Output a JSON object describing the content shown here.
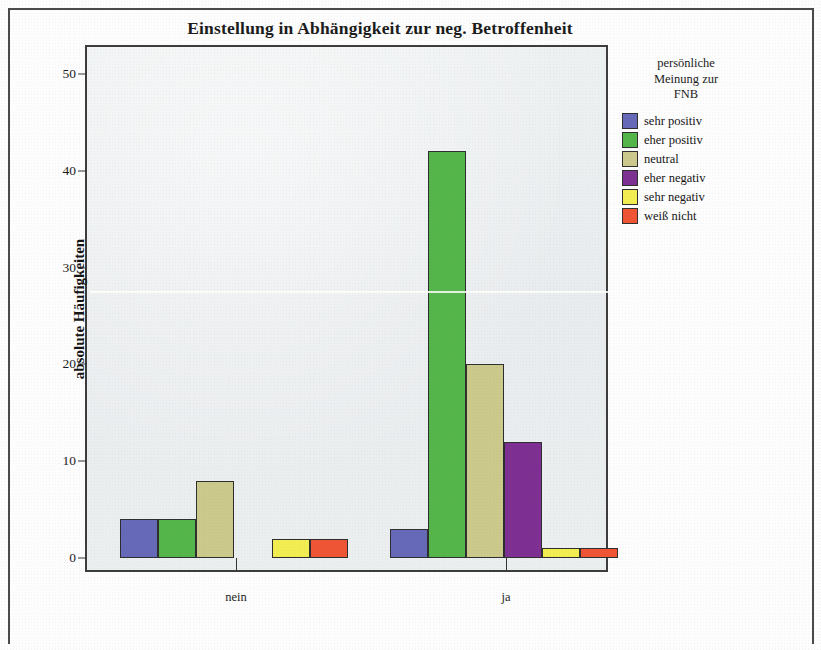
{
  "chart_data": {
    "type": "bar",
    "title": "Einstellung in Abhängigkeit zur neg. Betroffenheit",
    "xlabel": "",
    "ylabel": "absolute Häufigkeiten",
    "categories": [
      "nein",
      "ja"
    ],
    "ylim": [
      0,
      52
    ],
    "yticks": [
      0,
      10,
      20,
      30,
      40,
      50
    ],
    "ytick_labels": [
      "0",
      "10",
      "20",
      "30",
      "40",
      "50"
    ],
    "grid": false,
    "legend_position": "right",
    "legend_title": "persönliche\nMeinung zur\nFNB",
    "legend_title_lines": [
      "persönliche",
      "Meinung zur",
      "FNB"
    ],
    "series": [
      {
        "name": "sehr positiv",
        "color": "#6668b8",
        "values": [
          4,
          3
        ]
      },
      {
        "name": "eher positiv",
        "color": "#55b martial",
        "values": [
          4,
          42
        ]
      },
      {
        "name": "neutral",
        "color": "#cbc98c",
        "values": [
          8,
          20
        ]
      },
      {
        "name": "eher negativ",
        "color": "#7d3091",
        "values": [
          0,
          12
        ]
      },
      {
        "name": "sehr negativ",
        "color": "#f2ee52",
        "values": [
          2,
          1
        ]
      },
      {
        "name": "weiß nicht",
        "color": "#ef5535",
        "values": [
          2,
          1
        ]
      }
    ]
  },
  "legend": {
    "title_lines": [
      "persönliche",
      "Meinung zur",
      "FNB"
    ],
    "items": [
      {
        "label": "sehr positiv",
        "color": "#6668b8"
      },
      {
        "label": "eher positiv",
        "color": "#54b54a"
      },
      {
        "label": "neutral",
        "color": "#cbc98c"
      },
      {
        "label": "eher negativ",
        "color": "#7d3091"
      },
      {
        "label": "sehr negativ",
        "color": "#f2ee52"
      },
      {
        "label": "weiß nicht",
        "color": "#ef5535"
      }
    ]
  },
  "axis": {
    "y_title": "absolute Häufigkeiten",
    "y_ticks": [
      "50",
      "40",
      "30",
      "20",
      "10",
      "0"
    ],
    "x_labels": [
      "nein",
      "ja"
    ]
  }
}
